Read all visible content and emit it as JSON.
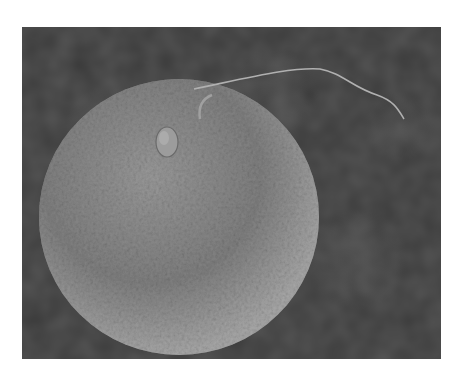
{
  "image": {
    "subject": "scanning electron micrograph of a sperm cell attached to an egg cell",
    "colors": {
      "background": "#3a3a3a",
      "egg_surface": "#8a8a8a",
      "sperm": "#9a9a9a",
      "border": "#ffffff"
    }
  }
}
